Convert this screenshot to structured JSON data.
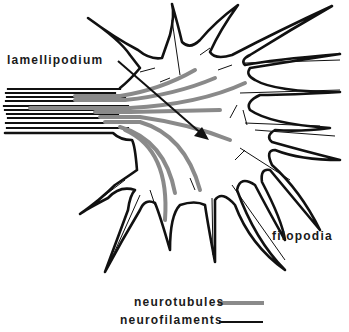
{
  "diagram": {
    "labels": {
      "lamellipodium": "lamellipodium",
      "filopodia": "filopodia"
    },
    "legend": {
      "items": [
        {
          "label": "neurotubules",
          "style": "thick gray stippled line",
          "color": "#8a8a8a"
        },
        {
          "label": "neurofilaments",
          "style": "thin black line",
          "color": "#111111"
        }
      ]
    },
    "colors": {
      "outline": "#111111",
      "neurotubule": "#8a8a8a",
      "background": "#ffffff"
    }
  }
}
